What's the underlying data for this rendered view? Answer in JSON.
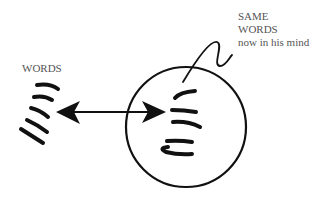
{
  "diagram": {
    "left_label": "WORDS",
    "right_label": {
      "line1": "SAME",
      "line2": "WORDS",
      "line3": "now in his mind"
    },
    "elements": {
      "head_circle": "head (circle representing a mind)",
      "double_arrow": "two-way arrow between external words and words in mind",
      "pointer_line": "squiggly pointer line from label to words inside circle"
    },
    "colors": {
      "ink": "#111111",
      "text": "#555555",
      "background": "#ffffff"
    }
  }
}
